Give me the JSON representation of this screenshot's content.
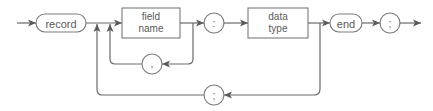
{
  "diagram": {
    "type": "syntax-diagram",
    "nodes": {
      "record": {
        "label": "record",
        "kind": "keyword"
      },
      "field_name": {
        "line1": "field",
        "line2": "name",
        "kind": "nonterminal"
      },
      "colon": {
        "label": ":",
        "kind": "symbol"
      },
      "data_type": {
        "line1": "data",
        "line2": "type",
        "kind": "nonterminal"
      },
      "end": {
        "label": "end",
        "kind": "keyword"
      },
      "semicolon_end": {
        "label": ";",
        "kind": "symbol"
      },
      "comma_loop": {
        "label": ",",
        "kind": "symbol"
      },
      "semicolon_loop": {
        "label": ";",
        "kind": "symbol"
      }
    },
    "colors": {
      "line": "#6a6a6a",
      "shape_stroke": "#7a7a7a",
      "text": "#5a5a5a",
      "background": "#ffffff"
    }
  }
}
